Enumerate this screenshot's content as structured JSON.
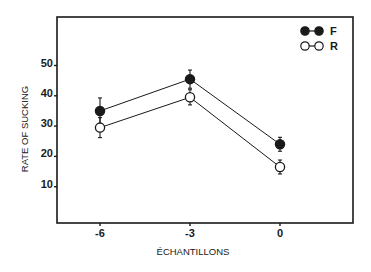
{
  "chart_data": {
    "type": "line",
    "title": "",
    "xlabel": "ÉCHANTILLONS",
    "ylabel": "RATE OF SUCKING",
    "categories": [
      "-6",
      "-3",
      "0"
    ],
    "x": [
      -6,
      -3,
      0
    ],
    "yticks": [
      10,
      20,
      30,
      40,
      50
    ],
    "ytick_labels": [
      "10",
      "20",
      "30",
      "40",
      "50"
    ],
    "ylim": [
      0,
      60
    ],
    "grid": false,
    "legend_position": "upper right",
    "series": [
      {
        "name": "F",
        "marker": "filled-circle",
        "values": [
          35,
          45.5,
          24
        ],
        "errors": [
          4.3,
          3,
          2.3
        ]
      },
      {
        "name": "R",
        "marker": "open-circle",
        "values": [
          29.5,
          39.5,
          16.5
        ],
        "errors": [
          3.3,
          2.5,
          2.3
        ]
      }
    ]
  },
  "colors": {
    "ink": "#1a1a1a",
    "background": "#ffffff"
  }
}
